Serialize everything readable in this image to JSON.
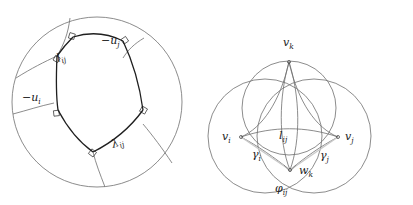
{
  "figure": {
    "background_color": "#ffffff",
    "stroke_color_thin": "#6e6e6e",
    "stroke_color_bold": "#1f1f1f",
    "stroke_color_faint": "#c9c9c9",
    "label_color": "#1a1a1a"
  },
  "left_panel": {
    "name": "hyperbolic-right-angled-pentagon",
    "disk": {
      "cx": 97,
      "cy": 102,
      "r": 85
    },
    "labels": [
      {
        "id": "l_ij",
        "base": "l",
        "sub": "ij",
        "x": 58,
        "y": 62,
        "rotate": -18
      },
      {
        "id": "-u_j",
        "base": "−u",
        "sub": "j",
        "x": 101,
        "y": 44,
        "rotate": 0
      },
      {
        "id": "-u_i",
        "base": "−u",
        "sub": "i",
        "x": 22,
        "y": 101,
        "rotate": 0
      },
      {
        "id": "lambda_ij",
        "base": "λ",
        "sub": "ij",
        "x": 113,
        "y": 148,
        "rotate": -20
      }
    ]
  },
  "right_panel": {
    "name": "three-mutually-intersecting-circles",
    "circles": [
      {
        "id": "circle-k",
        "cx": 289,
        "cy": 108,
        "r": 47
      },
      {
        "id": "circle-i",
        "cx": 265,
        "cy": 136,
        "r": 57
      },
      {
        "id": "circle-j",
        "cx": 314,
        "cy": 136,
        "r": 57
      }
    ],
    "points": [
      {
        "id": "v_k",
        "cx": 289,
        "cy": 62
      },
      {
        "id": "v_i",
        "cx": 241,
        "cy": 137
      },
      {
        "id": "v_j",
        "cx": 338,
        "cy": 137
      },
      {
        "id": "w_k",
        "cx": 290,
        "cy": 170
      }
    ],
    "labels": [
      {
        "id": "v_k",
        "base": "v",
        "sub": "k",
        "x": 283,
        "y": 46,
        "rotate": 0
      },
      {
        "id": "v_i",
        "base": "v",
        "sub": "i",
        "x": 222,
        "y": 140,
        "rotate": 0
      },
      {
        "id": "v_j",
        "base": "v",
        "sub": "j",
        "x": 345,
        "y": 140,
        "rotate": 0
      },
      {
        "id": "l_ij",
        "base": "l",
        "sub": "ij",
        "x": 279,
        "y": 139,
        "rotate": 0
      },
      {
        "id": "gamma_i",
        "base": "γ",
        "sub": "i",
        "x": 252,
        "y": 158,
        "rotate": 0
      },
      {
        "id": "gamma_j",
        "base": "γ",
        "sub": "j",
        "x": 320,
        "y": 159,
        "rotate": 0
      },
      {
        "id": "w_k",
        "base": "w",
        "sub": "k",
        "x": 299,
        "y": 174,
        "rotate": 0
      },
      {
        "id": "varphi_ij",
        "base": "φ",
        "sub": "ij",
        "x": 275,
        "y": 192,
        "rotate": 0
      }
    ]
  }
}
